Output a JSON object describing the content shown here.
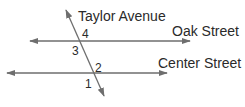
{
  "diagram": {
    "type": "parallel-lines-transversal",
    "line_color": "#6e6e6e",
    "text_color": "#2a2a2a",
    "labels": {
      "transversal": "Taylor Avenue",
      "top_line": "Oak Street",
      "bottom_line": "Center Street"
    },
    "angles": [
      {
        "id": "angle-1",
        "label": "1"
      },
      {
        "id": "angle-2",
        "label": "2"
      },
      {
        "id": "angle-3",
        "label": "3"
      },
      {
        "id": "angle-4",
        "label": "4"
      }
    ]
  }
}
